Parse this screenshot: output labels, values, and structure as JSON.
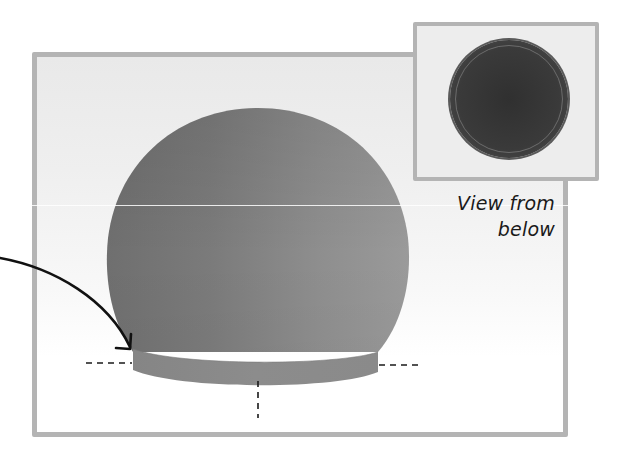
{
  "diagram": {
    "type": "illustration",
    "inset": {
      "caption_line1": "View from",
      "caption_line2": "below",
      "circle_color": "#353535",
      "border_color": "#b4b4b4"
    },
    "main_view": {
      "dome_color": "#8a8a8a",
      "base_band_color": "#8f8f8f",
      "frame_border_color": "#b4b4b4",
      "annotations": {
        "arrow": "curved-arrow pointing to dome base edge",
        "dashed_lines": [
          "left-horizontal",
          "right-horizontal",
          "center-vertical"
        ]
      }
    }
  }
}
